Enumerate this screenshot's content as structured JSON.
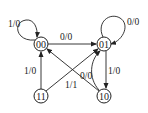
{
  "diagram": {
    "type": "state-transition",
    "nodes": [
      {
        "id": "00",
        "label": "00"
      },
      {
        "id": "01",
        "label": "01"
      },
      {
        "id": "11",
        "label": "11"
      },
      {
        "id": "10",
        "label": "10"
      }
    ],
    "edges": [
      {
        "from": "00",
        "to": "00",
        "label": "1/0"
      },
      {
        "from": "01",
        "to": "01",
        "label": "0/0"
      },
      {
        "from": "00",
        "to": "01",
        "label": "0/0"
      },
      {
        "from": "11",
        "to": "00",
        "label": "1/0"
      },
      {
        "from": "11",
        "to": "01",
        "label": "1/1"
      },
      {
        "from": "10",
        "to": "00",
        "label": "0/0"
      },
      {
        "from": "10",
        "to": "01",
        "label": ""
      },
      {
        "from": "01",
        "to": "10",
        "label": "1/0"
      }
    ]
  }
}
